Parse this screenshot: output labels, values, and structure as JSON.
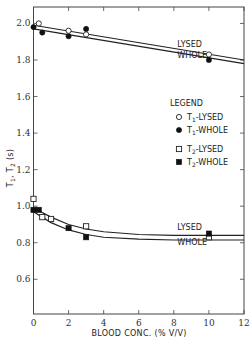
{
  "chart_data": {
    "type": "scatter",
    "title": "",
    "xlabel": "BLOOD CONC. (% V/V)",
    "ylabel": "T1, T2 (s)",
    "xlim": [
      0,
      12
    ],
    "ylim": [
      0.41,
      2.09
    ],
    "x_ticks": [
      0,
      2,
      4,
      6,
      8,
      10,
      12
    ],
    "y_ticks": [
      0.6,
      0.8,
      1.0,
      1.2,
      1.4,
      1.6,
      1.8,
      2.0
    ],
    "x_tick_labels": [
      "0",
      "2",
      "4",
      "6",
      "8",
      "10",
      "12"
    ],
    "y_tick_labels": [
      "0.6",
      "0.8",
      "1.0",
      "1.2",
      "1.4",
      "1.6",
      "1.8",
      "2.0"
    ],
    "grid": false,
    "legend": {
      "title": "LEGEND",
      "position": "right-middle",
      "entries": [
        {
          "label": "T1-LYSED",
          "marker": "open-circle"
        },
        {
          "label": "T1-WHOLE",
          "marker": "filled-circle"
        },
        {
          "label": "T2-LYSED",
          "marker": "open-square"
        },
        {
          "label": "T2-WHOLE",
          "marker": "filled-square"
        }
      ]
    },
    "series": [
      {
        "name": "T1-LYSED",
        "marker": "open-circle",
        "x": [
          0.3,
          2,
          3,
          10
        ],
        "y": [
          2.0,
          1.96,
          1.94,
          1.83
        ]
      },
      {
        "name": "T1-WHOLE",
        "marker": "filled-circle",
        "x": [
          0,
          0.5,
          2,
          3,
          10
        ],
        "y": [
          1.98,
          1.95,
          1.93,
          1.97,
          1.8
        ]
      },
      {
        "name": "T2-LYSED",
        "marker": "open-square",
        "x": [
          0,
          0.5,
          1,
          3,
          10
        ],
        "y": [
          1.04,
          0.94,
          0.93,
          0.89,
          0.83
        ]
      },
      {
        "name": "T2-WHOLE",
        "marker": "filled-square",
        "x": [
          0,
          0.3,
          2,
          3,
          10
        ],
        "y": [
          0.98,
          0.98,
          0.88,
          0.83,
          0.85
        ]
      }
    ],
    "fit_lines": [
      {
        "name": "T1 LYSED fit",
        "x": [
          0,
          12
        ],
        "y": [
          1.99,
          1.8
        ]
      },
      {
        "name": "T1 WHOLE fit",
        "x": [
          0,
          12
        ],
        "y": [
          1.97,
          1.78
        ]
      },
      {
        "name": "T2 LYSED fit",
        "x": [
          0,
          1,
          2,
          3,
          4,
          6,
          8,
          10
        ],
        "y": [
          0.99,
          0.94,
          0.9,
          0.875,
          0.86,
          0.845,
          0.84,
          0.84
        ]
      },
      {
        "name": "T2 WHOLE fit",
        "x": [
          0,
          1,
          2,
          3,
          4,
          6,
          8,
          10
        ],
        "y": [
          0.97,
          0.91,
          0.87,
          0.845,
          0.83,
          0.82,
          0.815,
          0.815
        ]
      }
    ],
    "annotations": [
      {
        "text": "LYSED",
        "x": 8.2,
        "y": 1.87
      },
      {
        "text": "WHOLE",
        "x": 8.2,
        "y": 1.81
      },
      {
        "text": "LYSED",
        "x": 8.2,
        "y": 0.87
      },
      {
        "text": "WHOLE",
        "x": 8.2,
        "y": 0.79
      }
    ]
  }
}
